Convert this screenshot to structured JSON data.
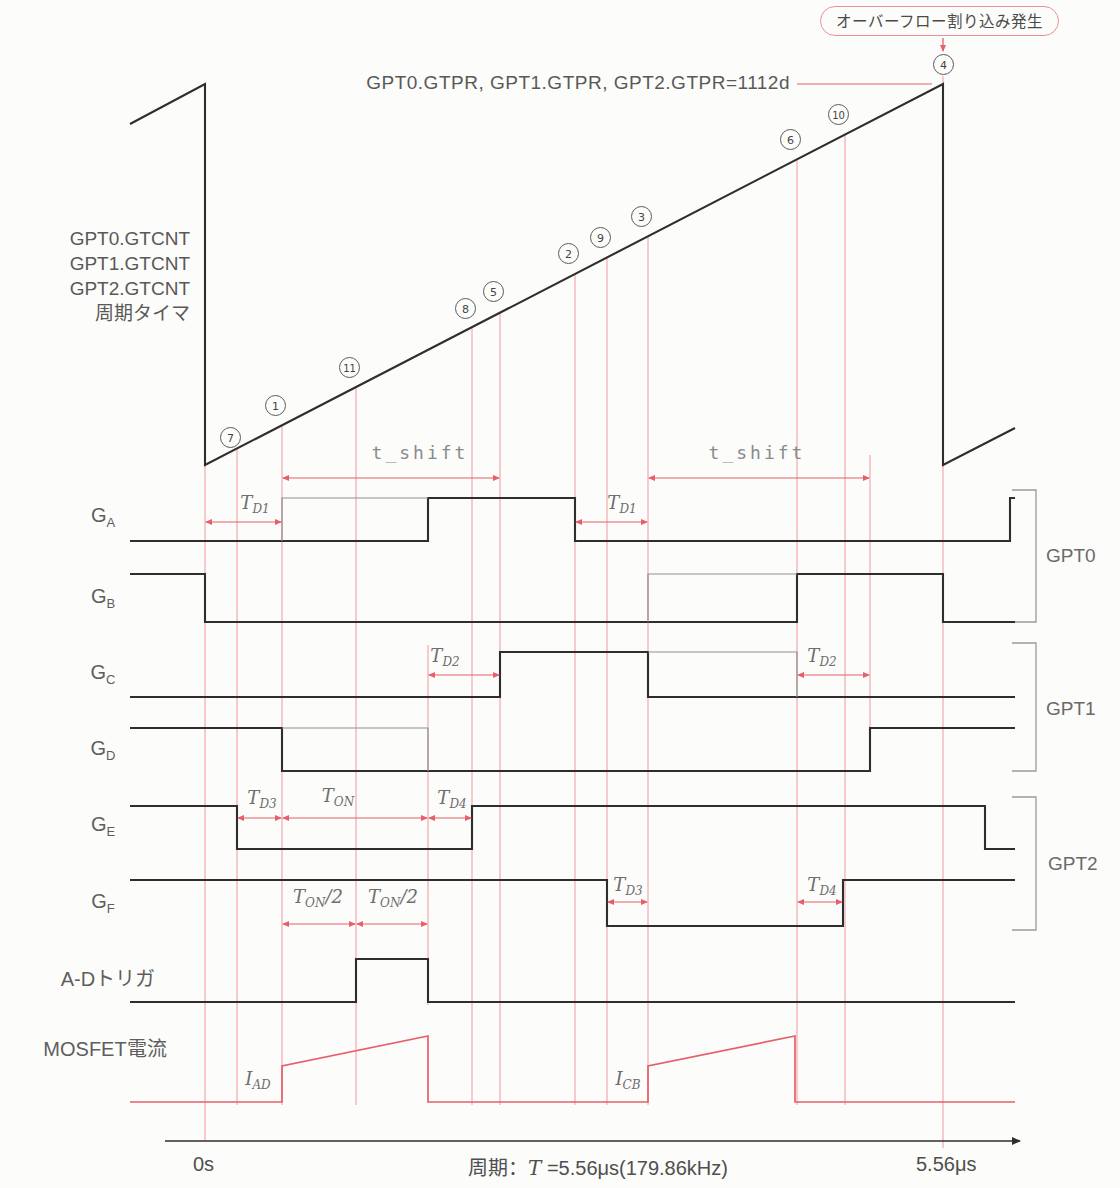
{
  "callout": {
    "text": "オーバーフロー割り込み発生"
  },
  "gtpr_label": "GPT0.GTPR, GPT1.GTPR, GPT2.GTPR=1112d",
  "counter_labels": [
    "GPT0.GTCNT",
    "GPT1.GTCNT",
    "GPT2.GTCNT",
    "周期タイマ"
  ],
  "ad_trigger_label": "A-Dトリガ",
  "mosfet_label": "MOSFET電流",
  "axis": {
    "zero": "0s",
    "period_prefix": "周期：",
    "period_T": "T",
    "period_suffix": " =5.56μs(179.86kHz)",
    "end": "5.56μs"
  },
  "row_labels": [
    {
      "main": "G",
      "sub": "A",
      "x": 103,
      "y": 517
    },
    {
      "main": "G",
      "sub": "B",
      "x": 103,
      "y": 598
    },
    {
      "main": "G",
      "sub": "C",
      "x": 103,
      "y": 674
    },
    {
      "main": "G",
      "sub": "D",
      "x": 103,
      "y": 750
    },
    {
      "main": "G",
      "sub": "E",
      "x": 103,
      "y": 826
    },
    {
      "main": "G",
      "sub": "F",
      "x": 103,
      "y": 903
    }
  ],
  "group_labels": [
    {
      "text": "GPT0",
      "x": 1046,
      "y": 545
    },
    {
      "text": "GPT1",
      "x": 1046,
      "y": 698
    },
    {
      "text": "GPT2",
      "x": 1048,
      "y": 853
    }
  ],
  "markers": [
    {
      "n": "7",
      "x": 230,
      "y": 437
    },
    {
      "n": "1",
      "x": 275,
      "y": 405
    },
    {
      "n": "11",
      "x": 349,
      "y": 367
    },
    {
      "n": "8",
      "x": 465,
      "y": 308
    },
    {
      "n": "5",
      "x": 493,
      "y": 291
    },
    {
      "n": "2",
      "x": 568,
      "y": 253
    },
    {
      "n": "9",
      "x": 600,
      "y": 237
    },
    {
      "n": "3",
      "x": 641,
      "y": 216
    },
    {
      "n": "6",
      "x": 790,
      "y": 139
    },
    {
      "n": "10",
      "x": 838,
      "y": 114
    },
    {
      "n": "4",
      "x": 943,
      "y": 64
    }
  ],
  "math_labels": [
    {
      "id": "td1-left",
      "main": "T",
      "sub": "D1",
      "suffix": "",
      "x": 255,
      "y": 504
    },
    {
      "id": "td1-right",
      "main": "T",
      "sub": "D1",
      "suffix": "",
      "x": 622,
      "y": 504
    },
    {
      "id": "td2-left",
      "main": "T",
      "sub": "D2",
      "suffix": "",
      "x": 445,
      "y": 657
    },
    {
      "id": "td2-right",
      "main": "T",
      "sub": "D2",
      "suffix": "",
      "x": 822,
      "y": 657
    },
    {
      "id": "td3-left",
      "main": "T",
      "sub": "D3",
      "suffix": "",
      "x": 262,
      "y": 799
    },
    {
      "id": "ton",
      "main": "T",
      "sub": "ON",
      "suffix": "",
      "x": 338,
      "y": 797
    },
    {
      "id": "td4-left",
      "main": "T",
      "sub": "D4",
      "suffix": "",
      "x": 452,
      "y": 799
    },
    {
      "id": "ton2-a",
      "main": "T",
      "sub": "ON",
      "suffix": "/2",
      "x": 318,
      "y": 898
    },
    {
      "id": "ton2-b",
      "main": "T",
      "sub": "ON",
      "suffix": "/2",
      "x": 393,
      "y": 898
    },
    {
      "id": "td3-right",
      "main": "T",
      "sub": "D3",
      "suffix": "",
      "x": 628,
      "y": 886
    },
    {
      "id": "td4-right",
      "main": "T",
      "sub": "D4",
      "suffix": "",
      "x": 822,
      "y": 886
    },
    {
      "id": "i-ad",
      "main": "I",
      "sub": "AD",
      "suffix": "",
      "x": 258,
      "y": 1080
    },
    {
      "id": "i-cb",
      "main": "I",
      "sub": "CB",
      "suffix": "",
      "x": 628,
      "y": 1080
    }
  ],
  "mono_labels": [
    {
      "id": "t-shift-left",
      "text": "t_shift",
      "x": 420,
      "y": 452
    },
    {
      "id": "t-shift-right",
      "text": "t_shift",
      "x": 757,
      "y": 452
    }
  ],
  "colors": {
    "black": "#2e2e2e",
    "gray_line": "#8f8f8f",
    "guide": "#f2a2a8",
    "red": "#e65f6b",
    "bracket": "#9a9a9a"
  },
  "diagram": {
    "guides": [
      {
        "x": 205,
        "y1": 465,
        "y2": 1141
      },
      {
        "x": 237,
        "y1": 448,
        "y2": 1105
      },
      {
        "x": 282,
        "y1": 425,
        "y2": 1105
      },
      {
        "x": 356,
        "y1": 387,
        "y2": 1105
      },
      {
        "x": 428,
        "y1": 645,
        "y2": 1005
      },
      {
        "x": 472,
        "y1": 327,
        "y2": 1105
      },
      {
        "x": 500,
        "y1": 312,
        "y2": 1105
      },
      {
        "x": 575,
        "y1": 274,
        "y2": 1105
      },
      {
        "x": 607,
        "y1": 257,
        "y2": 1105
      },
      {
        "x": 648,
        "y1": 236,
        "y2": 1105
      },
      {
        "x": 797,
        "y1": 159,
        "y2": 1105
      },
      {
        "x": 845,
        "y1": 134,
        "y2": 1105
      },
      {
        "x": 870,
        "y1": 455,
        "y2": 771
      },
      {
        "x": 943,
        "y1": 76,
        "y2": 1148
      }
    ],
    "signals": [
      {
        "name": "counter-ramp",
        "color": "black",
        "points": [
          [
            130,
            124
          ],
          [
            205,
            84
          ],
          [
            205,
            465
          ],
          [
            943,
            84
          ],
          [
            943,
            465
          ],
          [
            1015,
            428
          ]
        ]
      },
      {
        "name": "signal-ga",
        "color": "black",
        "points": [
          [
            130,
            541
          ],
          [
            428,
            541
          ],
          [
            428,
            498
          ],
          [
            575,
            498
          ],
          [
            575,
            541
          ],
          [
            1010,
            541
          ],
          [
            1010,
            498
          ],
          [
            1015,
            498
          ]
        ]
      },
      {
        "name": "signal-ga-pre",
        "color": "gray",
        "points": [
          [
            282,
            541
          ],
          [
            282,
            498
          ],
          [
            428,
            498
          ]
        ]
      },
      {
        "name": "signal-gb",
        "color": "black",
        "points": [
          [
            130,
            574
          ],
          [
            205,
            574
          ],
          [
            205,
            622
          ],
          [
            797,
            622
          ],
          [
            797,
            574
          ],
          [
            943,
            574
          ],
          [
            943,
            622
          ],
          [
            1015,
            622
          ]
        ]
      },
      {
        "name": "signal-gb-pre",
        "color": "gray",
        "points": [
          [
            648,
            622
          ],
          [
            648,
            574
          ],
          [
            797,
            574
          ]
        ]
      },
      {
        "name": "signal-gc",
        "color": "black",
        "points": [
          [
            130,
            697
          ],
          [
            500,
            697
          ],
          [
            500,
            652
          ],
          [
            648,
            652
          ],
          [
            648,
            697
          ],
          [
            1015,
            697
          ]
        ]
      },
      {
        "name": "signal-gc-pre",
        "color": "gray",
        "points": [
          [
            648,
            652
          ],
          [
            797,
            652
          ],
          [
            797,
            697
          ]
        ]
      },
      {
        "name": "signal-gd",
        "color": "black",
        "points": [
          [
            130,
            728
          ],
          [
            282,
            728
          ],
          [
            282,
            771
          ],
          [
            870,
            771
          ],
          [
            870,
            728
          ],
          [
            1015,
            728
          ]
        ]
      },
      {
        "name": "signal-gd-pre",
        "color": "gray",
        "points": [
          [
            282,
            728
          ],
          [
            428,
            728
          ],
          [
            428,
            771
          ]
        ]
      },
      {
        "name": "signal-ge",
        "color": "black",
        "points": [
          [
            130,
            806
          ],
          [
            237,
            806
          ],
          [
            237,
            849
          ],
          [
            472,
            849
          ],
          [
            472,
            806
          ],
          [
            985,
            806
          ],
          [
            985,
            849
          ],
          [
            1015,
            849
          ]
        ]
      },
      {
        "name": "signal-gf",
        "color": "black",
        "points": [
          [
            130,
            880
          ],
          [
            607,
            880
          ],
          [
            607,
            926
          ],
          [
            843,
            926
          ],
          [
            843,
            880
          ],
          [
            1015,
            880
          ]
        ]
      },
      {
        "name": "signal-ad-trigger",
        "color": "black",
        "points": [
          [
            130,
            1002
          ],
          [
            356,
            1002
          ],
          [
            356,
            959
          ],
          [
            428,
            959
          ],
          [
            428,
            1002
          ],
          [
            1015,
            1002
          ]
        ]
      },
      {
        "name": "signal-mosfet-current",
        "color": "red",
        "points": [
          [
            130,
            1102
          ],
          [
            282,
            1102
          ],
          [
            282,
            1066
          ],
          [
            428,
            1036
          ],
          [
            428,
            1102
          ],
          [
            648,
            1102
          ],
          [
            648,
            1066
          ],
          [
            795,
            1036
          ],
          [
            795,
            1102
          ],
          [
            1015,
            1102
          ]
        ]
      }
    ],
    "axis_line": {
      "x1": 165,
      "y": 1141,
      "x2": 1020
    },
    "connector": {
      "x1": 797,
      "y": 84,
      "x2": 932
    },
    "callout_arrow": {
      "x": 943,
      "y1": 38,
      "y2": 51
    },
    "brackets": [
      {
        "name": "bracket-gpt0",
        "x1": 1012,
        "x2": 1036,
        "y1": 490,
        "y2": 622
      },
      {
        "name": "bracket-gpt1",
        "x1": 1012,
        "x2": 1036,
        "y1": 643,
        "y2": 771
      },
      {
        "name": "bracket-gpt2",
        "x1": 1012,
        "x2": 1036,
        "y1": 797,
        "y2": 930
      }
    ],
    "arrows": [
      {
        "name": "arrow-td1-left",
        "x1": 205,
        "x2": 282,
        "y": 522
      },
      {
        "name": "arrow-td1-right",
        "x1": 575,
        "x2": 648,
        "y": 522
      },
      {
        "name": "arrow-td2-left",
        "x1": 428,
        "x2": 500,
        "y": 675
      },
      {
        "name": "arrow-td2-right",
        "x1": 797,
        "x2": 870,
        "y": 675
      },
      {
        "name": "arrow-td3-left",
        "x1": 237,
        "x2": 282,
        "y": 818
      },
      {
        "name": "arrow-ton",
        "x1": 282,
        "x2": 428,
        "y": 818
      },
      {
        "name": "arrow-td4-left",
        "x1": 428,
        "x2": 472,
        "y": 818
      },
      {
        "name": "arrow-ton2-a",
        "x1": 282,
        "x2": 356,
        "y": 924
      },
      {
        "name": "arrow-ton2-b",
        "x1": 356,
        "x2": 428,
        "y": 924
      },
      {
        "name": "arrow-td3-right",
        "x1": 607,
        "x2": 648,
        "y": 902
      },
      {
        "name": "arrow-td4-right",
        "x1": 797,
        "x2": 843,
        "y": 902
      },
      {
        "name": "arrow-tshift-left",
        "x1": 282,
        "x2": 500,
        "y": 478
      },
      {
        "name": "arrow-tshift-right",
        "x1": 648,
        "x2": 870,
        "y": 478
      }
    ]
  }
}
